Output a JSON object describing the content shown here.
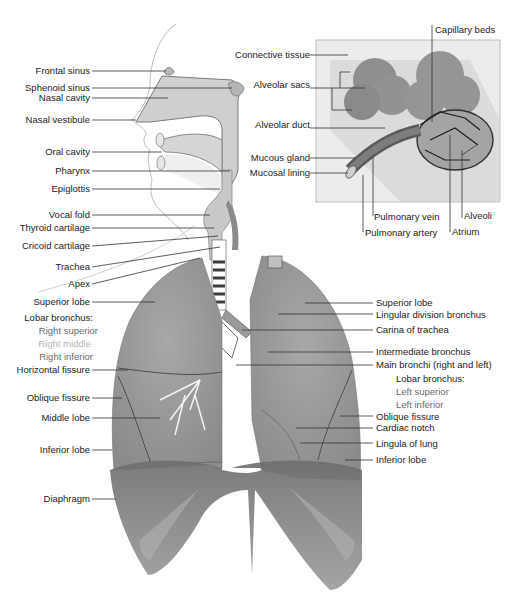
{
  "diagram": {
    "left_labels": [
      {
        "id": "frontal-sinus",
        "text": "Frontal sinus"
      },
      {
        "id": "sphenoid-sinus",
        "text": "Sphenoid sinus"
      },
      {
        "id": "nasal-cavity",
        "text": "Nasal cavity"
      },
      {
        "id": "nasal-vestibule",
        "text": "Nasal vestibule"
      },
      {
        "id": "oral-cavity",
        "text": "Oral cavity"
      },
      {
        "id": "pharynx",
        "text": "Pharynx"
      },
      {
        "id": "epiglottis",
        "text": "Epiglottis"
      },
      {
        "id": "vocal-fold",
        "text": "Vocal fold"
      },
      {
        "id": "thyroid-cartilage",
        "text": "Thyroid cartilage"
      },
      {
        "id": "cricoid-cartilage",
        "text": "Cricoid cartilage"
      },
      {
        "id": "trachea",
        "text": "Trachea"
      },
      {
        "id": "apex",
        "text": "Apex"
      },
      {
        "id": "superior-lobe-right",
        "text": "Superior lobe"
      },
      {
        "id": "lobar-bronchus-right",
        "text": "Lobar bronchus:"
      },
      {
        "id": "right-superior",
        "text": "Right superior"
      },
      {
        "id": "right-middle",
        "text": "Right middle"
      },
      {
        "id": "right-inferior",
        "text": "Right inferior"
      },
      {
        "id": "horizontal-fissure",
        "text": "Horizontal fissure"
      },
      {
        "id": "oblique-fissure-right",
        "text": "Oblique fissure"
      },
      {
        "id": "middle-lobe",
        "text": "Middle lobe"
      },
      {
        "id": "inferior-lobe-right",
        "text": "Inferior lobe"
      },
      {
        "id": "diaphragm",
        "text": "Diaphragm"
      }
    ],
    "inset_labels": [
      {
        "id": "connective-tissue",
        "text": "Connective tissue"
      },
      {
        "id": "alveolar-sacs",
        "text": "Alveolar sacs"
      },
      {
        "id": "alveolar-duct",
        "text": "Alveolar duct"
      },
      {
        "id": "mucous-gland",
        "text": "Mucous gland"
      },
      {
        "id": "mucosal-lining",
        "text": "Mucosal lining"
      },
      {
        "id": "capillary-beds",
        "text": "Capillary beds"
      },
      {
        "id": "pulmonary-vein",
        "text": "Pulmonary vein"
      },
      {
        "id": "pulmonary-artery",
        "text": "Pulmonary artery"
      },
      {
        "id": "alveoli",
        "text": "Alveoli"
      },
      {
        "id": "atrium",
        "text": "Atrium"
      }
    ],
    "right_labels": [
      {
        "id": "superior-lobe-left",
        "text": "Superior lobe"
      },
      {
        "id": "lingular-division-bronchus",
        "text": "Lingular division bronchus"
      },
      {
        "id": "carina-of-trachea",
        "text": "Carina of trachea"
      },
      {
        "id": "intermediate-bronchus",
        "text": "Intermediate bronchus"
      },
      {
        "id": "main-bronchi",
        "text": "Main bronchi (right and left)"
      },
      {
        "id": "lobar-bronchus-left",
        "text": "Lobar bronchus:"
      },
      {
        "id": "left-superior",
        "text": "Left superior"
      },
      {
        "id": "left-inferior",
        "text": "Left inferior"
      },
      {
        "id": "oblique-fissure-left",
        "text": "Oblique fissure"
      },
      {
        "id": "cardiac-notch",
        "text": "Cardiac notch"
      },
      {
        "id": "lingula-of-lung",
        "text": "Lingula of lung"
      },
      {
        "id": "inferior-lobe-left",
        "text": "Inferior lobe"
      }
    ]
  }
}
